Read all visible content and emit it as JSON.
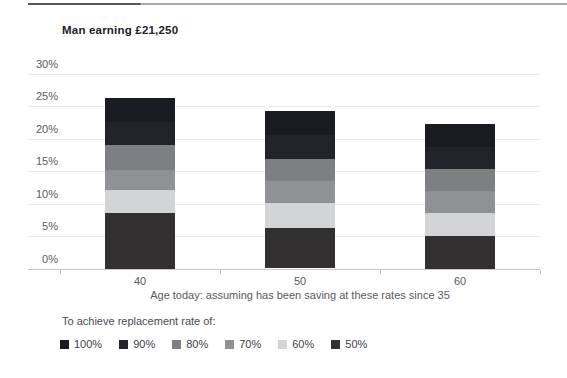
{
  "header": {
    "title": "Man earning £21,250"
  },
  "chart_data": {
    "type": "bar",
    "stacked": true,
    "title": "Man earning £21,250",
    "categories": [
      "40",
      "50",
      "60"
    ],
    "xlabel": "Age today: assuming has been saving at these rates since 35",
    "ylabel": "",
    "ylim": [
      0,
      30
    ],
    "ytick_step": 5,
    "ytick_labels": [
      "0%",
      "5%",
      "10%",
      "15%",
      "20%",
      "25%",
      "30%"
    ],
    "grid": true,
    "legend_title": "To achieve replacement rate of:",
    "legend_position": "bottom",
    "legend_order": [
      "100%",
      "90%",
      "80%",
      "70%",
      "60%",
      "50%"
    ],
    "series": [
      {
        "name": "50%",
        "color": "#333031",
        "values": [
          8.5,
          6.3,
          5.0
        ]
      },
      {
        "name": "60%",
        "color": "#d3d4d6",
        "values": [
          3.6,
          3.8,
          3.6
        ]
      },
      {
        "name": "70%",
        "color": "#8f9195",
        "values": [
          3.0,
          3.4,
          3.3
        ]
      },
      {
        "name": "80%",
        "color": "#7d7f83",
        "values": [
          3.9,
          3.4,
          3.4
        ]
      },
      {
        "name": "90%",
        "color": "#22222a",
        "values": [
          3.5,
          3.6,
          3.4
        ]
      },
      {
        "name": "100%",
        "color": "#1a1a22",
        "values": [
          3.7,
          3.7,
          3.5
        ]
      }
    ],
    "totals": [
      26.2,
      24.2,
      22.2
    ],
    "colors": {
      "gridline": "#ebebed",
      "axis_line": "#c6c7ca",
      "title_text": "#20202a",
      "tick_text": "#5a5b60"
    }
  }
}
